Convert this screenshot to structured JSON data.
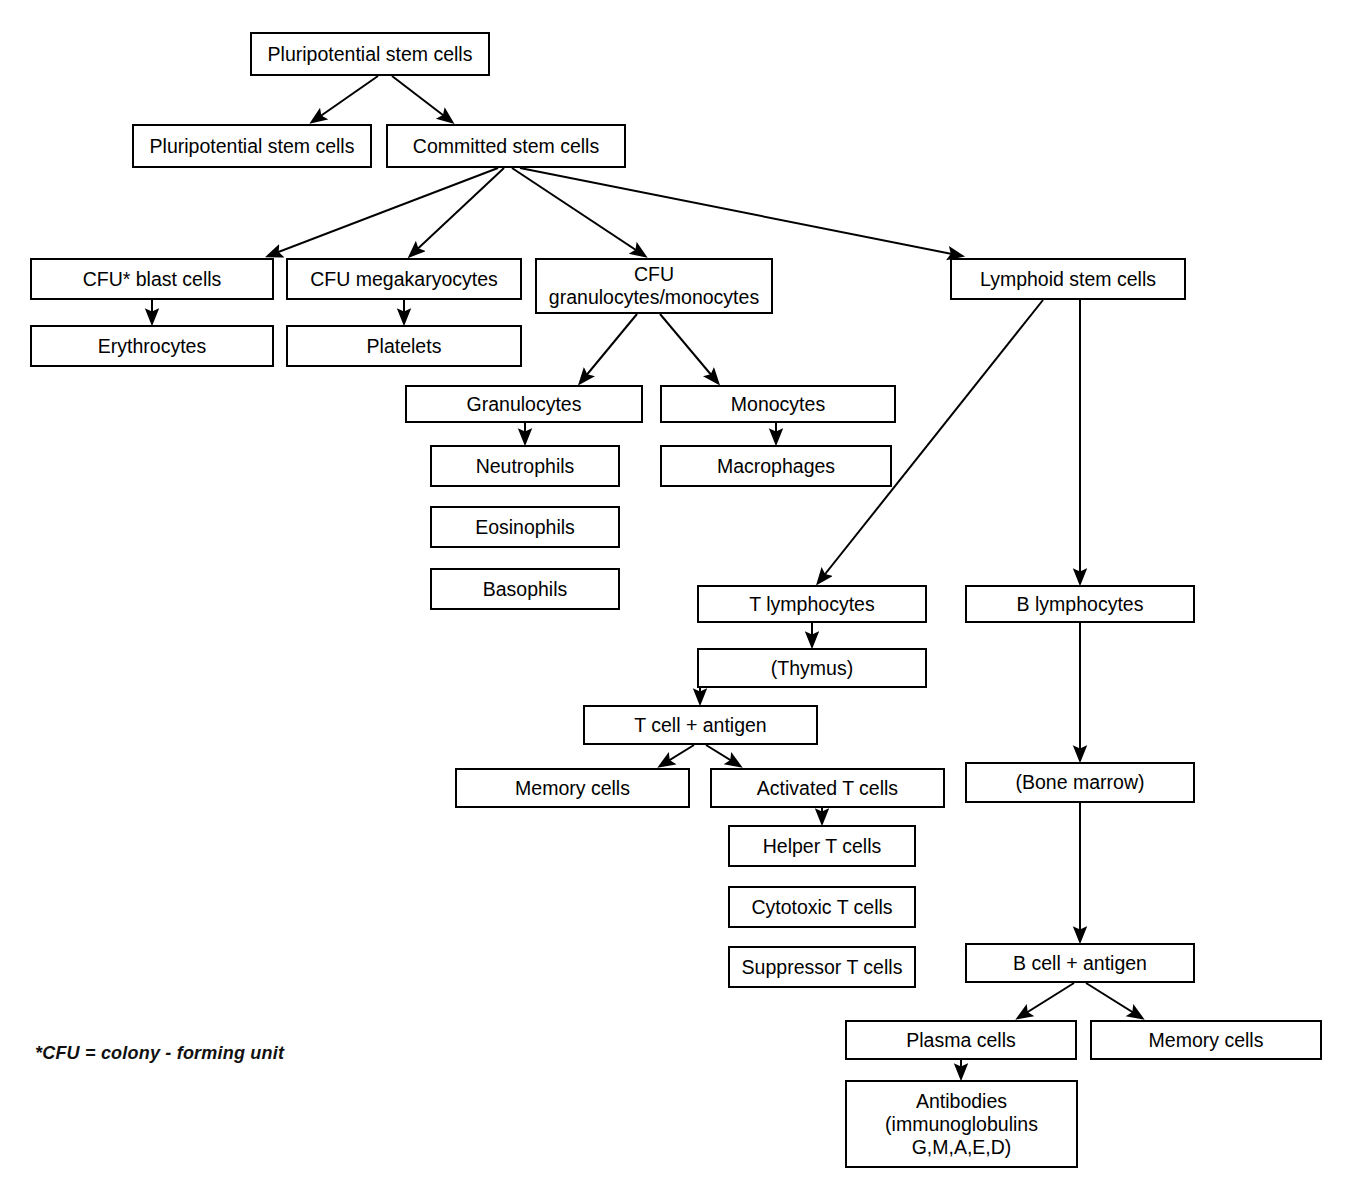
{
  "diagram": {
    "background_color": "#ffffff",
    "line_color": "#000000",
    "box_border_color": "#000000",
    "box_fill_color": "#ffffff",
    "canvas": {
      "width": 1355,
      "height": 1193
    },
    "footnote": "*CFU = colony - forming unit",
    "nodes": [
      {
        "id": "pluripotential_top",
        "label": "Pluripotential stem cells",
        "x": 250,
        "y": 32,
        "w": 240,
        "h": 44
      },
      {
        "id": "pluripotential_left",
        "label": "Pluripotential stem cells",
        "x": 132,
        "y": 124,
        "w": 240,
        "h": 44
      },
      {
        "id": "committed",
        "label": "Committed stem cells",
        "x": 386,
        "y": 124,
        "w": 240,
        "h": 44
      },
      {
        "id": "cfu_blast",
        "label": "CFU* blast cells",
        "x": 30,
        "y": 258,
        "w": 244,
        "h": 42
      },
      {
        "id": "erythrocytes",
        "label": "Erythrocytes",
        "x": 30,
        "y": 325,
        "w": 244,
        "h": 42
      },
      {
        "id": "cfu_megakaryocytes",
        "label": "CFU megakaryocytes",
        "x": 286,
        "y": 258,
        "w": 236,
        "h": 42
      },
      {
        "id": "platelets",
        "label": "Platelets",
        "x": 286,
        "y": 325,
        "w": 236,
        "h": 42
      },
      {
        "id": "cfu_gran_mono",
        "label": "CFU\ngranulocytes/monocytes",
        "x": 535,
        "y": 258,
        "w": 238,
        "h": 56
      },
      {
        "id": "lymphoid_stem",
        "label": "Lymphoid stem cells",
        "x": 950,
        "y": 258,
        "w": 236,
        "h": 42
      },
      {
        "id": "granulocytes",
        "label": "Granulocytes",
        "x": 405,
        "y": 385,
        "w": 238,
        "h": 38
      },
      {
        "id": "monocytes",
        "label": "Monocytes",
        "x": 660,
        "y": 385,
        "w": 236,
        "h": 38
      },
      {
        "id": "neutrophils",
        "label": "Neutrophils",
        "x": 430,
        "y": 445,
        "w": 190,
        "h": 42
      },
      {
        "id": "macrophages",
        "label": "Macrophages",
        "x": 660,
        "y": 445,
        "w": 232,
        "h": 42
      },
      {
        "id": "eosinophils",
        "label": "Eosinophils",
        "x": 430,
        "y": 506,
        "w": 190,
        "h": 42
      },
      {
        "id": "basophils",
        "label": "Basophils",
        "x": 430,
        "y": 568,
        "w": 190,
        "h": 42
      },
      {
        "id": "t_lymphocytes",
        "label": "T lymphocytes",
        "x": 697,
        "y": 585,
        "w": 230,
        "h": 38
      },
      {
        "id": "b_lymphocytes",
        "label": "B lymphocytes",
        "x": 965,
        "y": 585,
        "w": 230,
        "h": 38
      },
      {
        "id": "thymus",
        "label": "(Thymus)",
        "x": 697,
        "y": 648,
        "w": 230,
        "h": 40
      },
      {
        "id": "t_cell_antigen",
        "label": "T cell + antigen",
        "x": 583,
        "y": 705,
        "w": 235,
        "h": 40
      },
      {
        "id": "memory_cells_t",
        "label": "Memory cells",
        "x": 455,
        "y": 768,
        "w": 235,
        "h": 40
      },
      {
        "id": "activated_t_cells",
        "label": "Activated T cells",
        "x": 710,
        "y": 768,
        "w": 235,
        "h": 40
      },
      {
        "id": "bone_marrow",
        "label": "(Bone marrow)",
        "x": 965,
        "y": 762,
        "w": 230,
        "h": 41
      },
      {
        "id": "helper_t_cells",
        "label": "Helper T cells",
        "x": 728,
        "y": 825,
        "w": 188,
        "h": 42
      },
      {
        "id": "cytotoxic_t_cells",
        "label": "Cytotoxic T cells",
        "x": 728,
        "y": 886,
        "w": 188,
        "h": 42
      },
      {
        "id": "suppressor_t_cells",
        "label": "Suppressor T cells",
        "x": 728,
        "y": 946,
        "w": 188,
        "h": 42
      },
      {
        "id": "b_cell_antigen",
        "label": "B cell + antigen",
        "x": 965,
        "y": 943,
        "w": 230,
        "h": 40
      },
      {
        "id": "plasma_cells",
        "label": "Plasma cells",
        "x": 845,
        "y": 1020,
        "w": 232,
        "h": 40
      },
      {
        "id": "memory_cells_b",
        "label": "Memory cells",
        "x": 1090,
        "y": 1020,
        "w": 232,
        "h": 40
      },
      {
        "id": "antibodies",
        "label": "Antibodies\n(immunoglobulins\nG,M,A,E,D)",
        "x": 845,
        "y": 1080,
        "w": 233,
        "h": 88
      }
    ],
    "edges": [
      {
        "from": "pluripotential_top",
        "to": "pluripotential_left",
        "x1": 378,
        "y1": 76,
        "x2": 312,
        "y2": 122
      },
      {
        "from": "pluripotential_top",
        "to": "committed",
        "x1": 392,
        "y1": 76,
        "x2": 452,
        "y2": 122
      },
      {
        "from": "committed",
        "to": "cfu_blast",
        "x1": 498,
        "y1": 168,
        "x2": 268,
        "y2": 256
      },
      {
        "from": "committed",
        "to": "cfu_megakaryocytes",
        "x1": 504,
        "y1": 168,
        "x2": 410,
        "y2": 256
      },
      {
        "from": "committed",
        "to": "cfu_gran_mono",
        "x1": 512,
        "y1": 168,
        "x2": 645,
        "y2": 256
      },
      {
        "from": "committed",
        "to": "lymphoid_stem",
        "x1": 520,
        "y1": 168,
        "x2": 962,
        "y2": 256
      },
      {
        "from": "cfu_blast",
        "to": "erythrocytes",
        "x1": 152,
        "y1": 300,
        "x2": 152,
        "y2": 323
      },
      {
        "from": "cfu_megakaryocytes",
        "to": "platelets",
        "x1": 404,
        "y1": 300,
        "x2": 404,
        "y2": 323
      },
      {
        "from": "cfu_gran_mono",
        "to": "granulocytes",
        "x1": 637,
        "y1": 314,
        "x2": 580,
        "y2": 383
      },
      {
        "from": "cfu_gran_mono",
        "to": "monocytes",
        "x1": 660,
        "y1": 314,
        "x2": 718,
        "y2": 383
      },
      {
        "from": "granulocytes",
        "to": "neutrophils",
        "x1": 525,
        "y1": 423,
        "x2": 525,
        "y2": 443
      },
      {
        "from": "monocytes",
        "to": "macrophages",
        "x1": 776,
        "y1": 423,
        "x2": 776,
        "y2": 443
      },
      {
        "from": "lymphoid_stem",
        "to": "t_lymphocytes",
        "x1": 1043,
        "y1": 300,
        "x2": 818,
        "y2": 583
      },
      {
        "from": "lymphoid_stem",
        "to": "b_lymphocytes",
        "x1": 1080,
        "y1": 300,
        "x2": 1080,
        "y2": 583
      },
      {
        "from": "t_lymphocytes",
        "to": "thymus",
        "x1": 812,
        "y1": 623,
        "x2": 812,
        "y2": 646
      },
      {
        "from": "thymus",
        "to": "t_cell_antigen",
        "x1": 700,
        "y1": 688,
        "x2": 700,
        "y2": 703
      },
      {
        "from": "t_cell_antigen",
        "to": "memory_cells_t",
        "x1": 694,
        "y1": 745,
        "x2": 660,
        "y2": 766
      },
      {
        "from": "t_cell_antigen",
        "to": "activated_t_cells",
        "x1": 706,
        "y1": 745,
        "x2": 740,
        "y2": 766
      },
      {
        "from": "activated_t_cells",
        "to": "helper_t_cells",
        "x1": 822,
        "y1": 808,
        "x2": 822,
        "y2": 823
      },
      {
        "from": "b_lymphocytes",
        "to": "bone_marrow",
        "x1": 1080,
        "y1": 623,
        "x2": 1080,
        "y2": 760
      },
      {
        "from": "bone_marrow",
        "to": "b_cell_antigen",
        "x1": 1080,
        "y1": 803,
        "x2": 1080,
        "y2": 941
      },
      {
        "from": "b_cell_antigen",
        "to": "plasma_cells",
        "x1": 1074,
        "y1": 983,
        "x2": 1018,
        "y2": 1018
      },
      {
        "from": "b_cell_antigen",
        "to": "memory_cells_b",
        "x1": 1086,
        "y1": 983,
        "x2": 1142,
        "y2": 1018
      },
      {
        "from": "plasma_cells",
        "to": "antibodies",
        "x1": 961,
        "y1": 1060,
        "x2": 961,
        "y2": 1078
      }
    ]
  }
}
